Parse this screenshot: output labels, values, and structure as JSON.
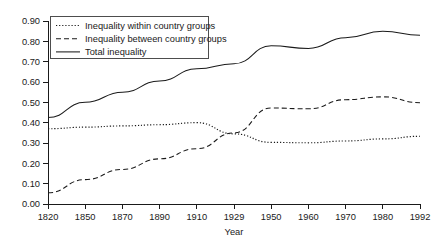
{
  "chart_data": {
    "type": "line",
    "title": "",
    "xlabel": "Year",
    "ylabel": "",
    "categories": [
      "1820",
      "1850",
      "1870",
      "1890",
      "1910",
      "1929",
      "1950",
      "1960",
      "1970",
      "1980",
      "1992"
    ],
    "x": [
      1820,
      1850,
      1870,
      1890,
      1910,
      1929,
      1950,
      1960,
      1970,
      1980,
      1992
    ],
    "ylim": [
      0.0,
      0.9
    ],
    "ytick_labels": [
      "0.00",
      "0.10",
      "0.20",
      "0.30",
      "0.40",
      "0.50",
      "0.60",
      "0.70",
      "0.80",
      "0.90"
    ],
    "ytick_values": [
      0.0,
      0.1,
      0.2,
      0.3,
      0.4,
      0.5,
      0.6,
      0.7,
      0.8,
      0.9
    ],
    "grid": false,
    "legend_position": "top-left",
    "series": [
      {
        "name": "Inequality within country groups",
        "style": "dotted",
        "values": [
          0.37,
          0.378,
          0.384,
          0.39,
          0.4,
          0.345,
          0.303,
          0.301,
          0.31,
          0.32,
          0.333
        ]
      },
      {
        "name": "Inequality between country groups",
        "style": "dashed",
        "values": [
          0.055,
          0.12,
          0.17,
          0.222,
          0.272,
          0.35,
          0.472,
          0.468,
          0.513,
          0.527,
          0.498
        ]
      },
      {
        "name": "Total inequality",
        "style": "solid",
        "values": [
          0.425,
          0.5,
          0.55,
          0.605,
          0.665,
          0.69,
          0.778,
          0.765,
          0.818,
          0.85,
          0.83
        ]
      }
    ]
  },
  "axis": {
    "x_title": "Year"
  },
  "legend": {
    "entries": [
      {
        "label": "Inequality within country groups",
        "style": "dotted"
      },
      {
        "label": "Inequality between country groups",
        "style": "dashed"
      },
      {
        "label": "Total inequality",
        "style": "solid"
      }
    ]
  },
  "colors": {
    "line": "#1a1a1a",
    "axis": "#1a1a1a",
    "background": "#ffffff",
    "legend_border": "#4d4d4d"
  }
}
